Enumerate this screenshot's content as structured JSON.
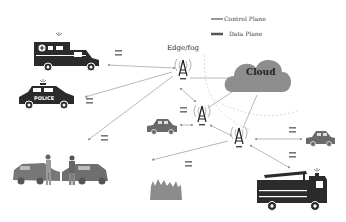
{
  "diagram": {
    "legend": [
      {
        "label": "Control Plane",
        "style": "thin-line"
      },
      {
        "label": "Data Plane",
        "style": "thick-line"
      }
    ],
    "edge_label": "Edge/fog",
    "cloud_label": "Cloud",
    "nodes": [
      {
        "id": "ambulance",
        "label": "Ambulance",
        "icon": "ambulance-icon"
      },
      {
        "id": "police-car",
        "label": "Police car",
        "icon": "police-car-icon",
        "badge_text": "POLICE"
      },
      {
        "id": "car-crash",
        "label": "Car crash",
        "icon": "car-crash-icon"
      },
      {
        "id": "fire",
        "label": "Fire",
        "icon": "fire-icon"
      },
      {
        "id": "fire-truck",
        "label": "Fire truck",
        "icon": "fire-truck-icon"
      },
      {
        "id": "car-middle",
        "label": "Car",
        "icon": "car-icon"
      },
      {
        "id": "car-right",
        "label": "Car",
        "icon": "car-icon"
      },
      {
        "id": "tower-1",
        "label": "Edge/fog tower",
        "icon": "cell-tower-icon"
      },
      {
        "id": "tower-2",
        "label": "Edge/fog tower",
        "icon": "cell-tower-icon"
      },
      {
        "id": "tower-3",
        "label": "Edge/fog tower",
        "icon": "cell-tower-icon"
      },
      {
        "id": "cloud",
        "label": "Cloud",
        "icon": "cloud-icon"
      }
    ],
    "colors": {
      "icon_dark": "#2b2b2b",
      "icon_gray": "#7a7a7a",
      "cloud_fill": "#8a8a8a",
      "line": "#9a9a9a",
      "tower_wave": "#c0c0c0"
    }
  }
}
